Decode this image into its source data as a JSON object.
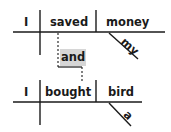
{
  "diagram": {
    "type": "sentence-diagram",
    "colors": {
      "line": "#1a1a1a",
      "text": "#1a1a1a",
      "conjunction_bg": "#d6d6d6",
      "background": "#ffffff"
    },
    "clause1": {
      "subject": "I",
      "verb": "saved",
      "object": "money",
      "modifier": "my"
    },
    "conjunction": "and",
    "clause2": {
      "subject": "I",
      "verb": "bought",
      "object": "bird",
      "modifier": "a"
    }
  }
}
